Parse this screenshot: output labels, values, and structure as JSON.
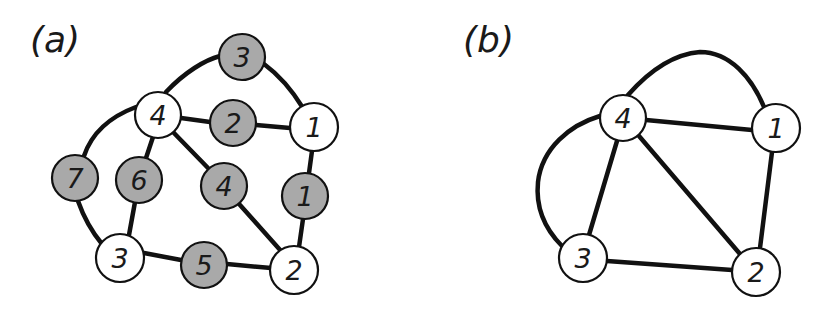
{
  "panels": [
    {
      "label": "(a)",
      "vertices": [
        {
          "id": "v4",
          "label": "4",
          "x": 158,
          "y": 115,
          "fill": "white"
        },
        {
          "id": "v1",
          "label": "1",
          "x": 314,
          "y": 127,
          "fill": "white"
        },
        {
          "id": "v3",
          "label": "3",
          "x": 120,
          "y": 258,
          "fill": "white"
        },
        {
          "id": "v2",
          "label": "2",
          "x": 294,
          "y": 270,
          "fill": "white"
        }
      ],
      "edge_nodes": [
        {
          "id": "e3",
          "label": "3",
          "x": 242,
          "y": 57,
          "fill": "gray"
        },
        {
          "id": "e2",
          "label": "2",
          "x": 233,
          "y": 123,
          "fill": "gray"
        },
        {
          "id": "e7",
          "label": "7",
          "x": 75,
          "y": 178,
          "fill": "gray"
        },
        {
          "id": "e6",
          "label": "6",
          "x": 139,
          "y": 180,
          "fill": "gray"
        },
        {
          "id": "e4",
          "label": "4",
          "x": 224,
          "y": 186,
          "fill": "gray"
        },
        {
          "id": "e1",
          "label": "1",
          "x": 305,
          "y": 196,
          "fill": "gray"
        },
        {
          "id": "e5",
          "label": "5",
          "x": 204,
          "y": 265,
          "fill": "gray"
        }
      ]
    },
    {
      "label": "(b)",
      "vertices": [
        {
          "id": "v4",
          "label": "4",
          "x": 623,
          "y": 118,
          "fill": "white"
        },
        {
          "id": "v1",
          "label": "1",
          "x": 776,
          "y": 128,
          "fill": "white"
        },
        {
          "id": "v3",
          "label": "3",
          "x": 583,
          "y": 258,
          "fill": "white"
        },
        {
          "id": "v2",
          "label": "2",
          "x": 756,
          "y": 272,
          "fill": "white"
        }
      ],
      "edges": [
        [
          "4",
          "1"
        ],
        [
          "4",
          "1"
        ],
        [
          "4",
          "3"
        ],
        [
          "4",
          "3"
        ],
        [
          "4",
          "2"
        ],
        [
          "1",
          "2"
        ],
        [
          "3",
          "2"
        ]
      ]
    }
  ],
  "colors": {
    "edge": "#111111",
    "gray_fill": "#a9a9a9",
    "white_fill": "#ffffff"
  }
}
